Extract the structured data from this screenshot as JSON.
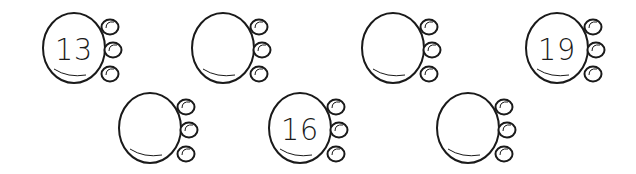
{
  "worksheet": {
    "description": "Number sequence bugs",
    "bugs": [
      {
        "id": "bug-1",
        "row": 1,
        "number": "13"
      },
      {
        "id": "bug-2",
        "row": 1,
        "number": ""
      },
      {
        "id": "bug-3",
        "row": 1,
        "number": ""
      },
      {
        "id": "bug-4",
        "row": 1,
        "number": "19"
      },
      {
        "id": "bug-5",
        "row": 2,
        "number": ""
      },
      {
        "id": "bug-6",
        "row": 2,
        "number": "16"
      },
      {
        "id": "bug-7",
        "row": 2,
        "number": ""
      }
    ]
  },
  "colors": {
    "line": "#1a1a1a",
    "background": "#ffffff"
  }
}
